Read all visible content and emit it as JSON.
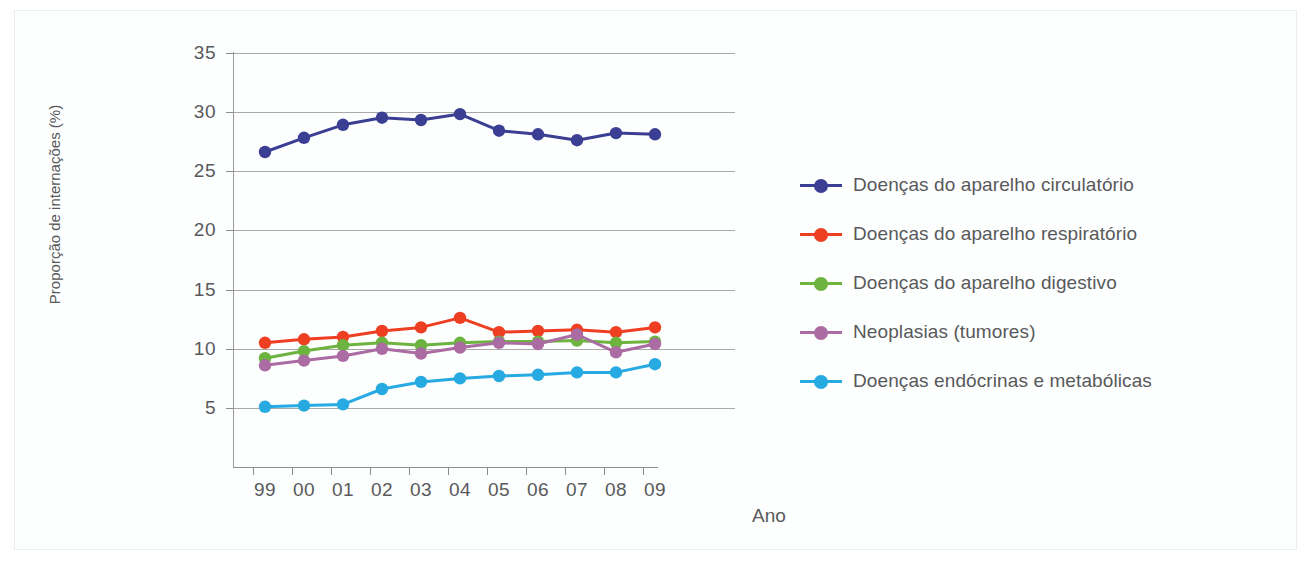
{
  "chart_data": {
    "type": "line",
    "title": "",
    "xlabel": "Ano",
    "ylabel": "Proporção de internações (%)",
    "categories": [
      "99",
      "00",
      "01",
      "02",
      "03",
      "04",
      "05",
      "06",
      "07",
      "08",
      "09"
    ],
    "ylim": [
      0,
      35
    ],
    "yticks": [
      5,
      10,
      15,
      20,
      25,
      30,
      35
    ],
    "grid": true,
    "legend_position": "right",
    "series": [
      {
        "name": "Doenças do aparelho circulatório",
        "color": "#3b3f93",
        "values": [
          26.6,
          27.8,
          28.9,
          29.5,
          29.3,
          29.8,
          28.4,
          28.1,
          27.6,
          28.2,
          28.1
        ]
      },
      {
        "name": "Doenças do aparelho respiratório",
        "color": "#ee3f23",
        "values": [
          10.5,
          10.8,
          11.0,
          11.5,
          11.8,
          12.6,
          11.4,
          11.5,
          11.6,
          11.4,
          11.8
        ]
      },
      {
        "name": "Doenças do aparelho digestivo",
        "color": "#6cb33f",
        "values": [
          9.2,
          9.8,
          10.3,
          10.5,
          10.3,
          10.5,
          10.6,
          10.6,
          10.7,
          10.5,
          10.6
        ]
      },
      {
        "name": "Neoplasias (tumores)",
        "color": "#ab6ba3",
        "values": [
          8.6,
          9.0,
          9.4,
          10.0,
          9.6,
          10.1,
          10.5,
          10.4,
          11.2,
          9.7,
          10.4
        ]
      },
      {
        "name": "Doenças endócrinas e metabólicas",
        "color": "#27aae1",
        "values": [
          5.1,
          5.2,
          5.3,
          6.6,
          7.2,
          7.5,
          7.7,
          7.8,
          8.0,
          8.0,
          8.7
        ]
      }
    ]
  },
  "axis": {
    "ytick_labels": [
      "35",
      "30",
      "25",
      "20",
      "15",
      "10",
      "5"
    ],
    "xtick_labels": [
      "99",
      "00",
      "01",
      "02",
      "03",
      "04",
      "05",
      "06",
      "07",
      "08",
      "09"
    ],
    "y_title": "Proporção de internações (%)",
    "x_title": "Ano"
  },
  "legend": {
    "items": [
      {
        "label": "Doenças do aparelho circulatório",
        "color": "#3b3f93"
      },
      {
        "label": "Doenças do aparelho respiratório",
        "color": "#ee3f23"
      },
      {
        "label": "Doenças do aparelho digestivo",
        "color": "#6cb33f"
      },
      {
        "label": "Neoplasias (tumores)",
        "color": "#ab6ba3"
      },
      {
        "label": "Doenças endócrinas e metabólicas",
        "color": "#27aae1"
      }
    ]
  }
}
